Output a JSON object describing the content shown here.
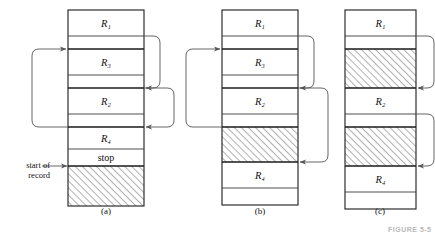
{
  "figure": {
    "caption_partial": "FIGURE 5-5",
    "start_of_record_label_line1": "start of",
    "start_of_record_label_line2": "record"
  },
  "panels": [
    {
      "key": "a",
      "caption": "(a)",
      "x": 68,
      "width": 76,
      "top": 10,
      "rows": [
        {
          "name": "row-r1",
          "label": "R₁",
          "height": 26,
          "fill": "none",
          "thick_top": true
        },
        {
          "name": "row-gap-1",
          "label": "",
          "height": 13,
          "fill": "none",
          "thick_top": false
        },
        {
          "name": "row-r3",
          "label": "R₃",
          "height": 26,
          "fill": "none",
          "thick_top": true
        },
        {
          "name": "row-gap-2",
          "label": "",
          "height": 13,
          "fill": "none",
          "thick_top": false
        },
        {
          "name": "row-r2",
          "label": "R₂",
          "height": 26,
          "fill": "none",
          "thick_top": true
        },
        {
          "name": "row-gap-3",
          "label": "",
          "height": 13,
          "fill": "none",
          "thick_top": false
        },
        {
          "name": "row-r4",
          "label": "R₄",
          "height": 22,
          "fill": "none",
          "thick_top": true
        },
        {
          "name": "row-stop",
          "label": "stop",
          "height": 17,
          "fill": "none",
          "thick_top": false
        },
        {
          "name": "row-free-space",
          "label": "",
          "height": 40,
          "fill": "hatch",
          "thick_top": true
        }
      ],
      "arrows_left": [
        {
          "name": "pointer-arrow-left-a1",
          "from_row": 6,
          "to_row": 2,
          "extent": 36
        }
      ],
      "arrows_right": [
        {
          "name": "pointer-arrow-right-a1",
          "from_row": 1,
          "to_row": 4,
          "extent": 16
        },
        {
          "name": "pointer-arrow-right-a2",
          "from_row": 4,
          "to_row": 6,
          "extent": 30
        }
      ],
      "start_marker_row": 8
    },
    {
      "key": "b",
      "caption": "(b)",
      "x": 222,
      "width": 76,
      "top": 10,
      "rows": [
        {
          "name": "row-r1",
          "label": "R₁",
          "height": 26,
          "fill": "none",
          "thick_top": true
        },
        {
          "name": "row-gap-1",
          "label": "",
          "height": 13,
          "fill": "none",
          "thick_top": false
        },
        {
          "name": "row-r3",
          "label": "R₃",
          "height": 26,
          "fill": "none",
          "thick_top": true
        },
        {
          "name": "row-gap-2",
          "label": "",
          "height": 13,
          "fill": "none",
          "thick_top": false
        },
        {
          "name": "row-r2",
          "label": "R₂",
          "height": 26,
          "fill": "none",
          "thick_top": true
        },
        {
          "name": "row-gap-3",
          "label": "",
          "height": 13,
          "fill": "none",
          "thick_top": false
        },
        {
          "name": "row-free-space",
          "label": "",
          "height": 35,
          "fill": "hatch",
          "thick_top": true
        },
        {
          "name": "row-r4",
          "label": "R₄",
          "height": 26,
          "fill": "none",
          "thick_top": true
        },
        {
          "name": "row-gap-4",
          "label": "",
          "height": 17,
          "fill": "none",
          "thick_top": false
        }
      ],
      "arrows_left": [
        {
          "name": "pointer-arrow-left-b1",
          "from_row": 6,
          "to_row": 2,
          "extent": 36
        }
      ],
      "arrows_right": [
        {
          "name": "pointer-arrow-right-b1",
          "from_row": 1,
          "to_row": 4,
          "extent": 16
        },
        {
          "name": "pointer-arrow-right-b2",
          "from_row": 4,
          "to_row": 7,
          "extent": 30
        }
      ],
      "start_marker_row": -1
    },
    {
      "key": "c",
      "caption": "(c)",
      "x": 345,
      "width": 71,
      "top": 10,
      "rows": [
        {
          "name": "row-r1",
          "label": "R₁",
          "height": 26,
          "fill": "none",
          "thick_top": true
        },
        {
          "name": "row-gap-1",
          "label": "",
          "height": 13,
          "fill": "none",
          "thick_top": false
        },
        {
          "name": "row-free-space-1",
          "label": "",
          "height": 39,
          "fill": "hatch",
          "thick_top": true
        },
        {
          "name": "row-r2",
          "label": "R₂",
          "height": 26,
          "fill": "none",
          "thick_top": true
        },
        {
          "name": "row-gap-2",
          "label": "",
          "height": 13,
          "fill": "none",
          "thick_top": false
        },
        {
          "name": "row-free-space-2",
          "label": "",
          "height": 39,
          "fill": "hatch",
          "thick_top": true
        },
        {
          "name": "row-r4",
          "label": "R₄",
          "height": 26,
          "fill": "none",
          "thick_top": true
        },
        {
          "name": "row-gap-3",
          "label": "",
          "height": 17,
          "fill": "none",
          "thick_top": false
        }
      ],
      "arrows_left": [],
      "arrows_right": [
        {
          "name": "pointer-arrow-right-c1",
          "from_row": 1,
          "to_row": 3,
          "extent": 18
        },
        {
          "name": "pointer-arrow-right-c2",
          "from_row": 4,
          "to_row": 6,
          "extent": 18
        }
      ],
      "start_marker_row": -1
    }
  ],
  "colors": {
    "stroke": "#3a3a3a",
    "thick_stroke": "#1a1a1a",
    "hatch": "#6e6e6e",
    "arrow": "#555555",
    "text": "#111111",
    "figcap": "#b8b8b8"
  }
}
